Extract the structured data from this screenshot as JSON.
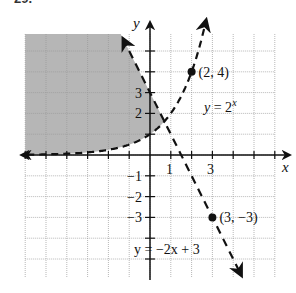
{
  "top_label": "29.",
  "chart_data": {
    "type": "line",
    "title": "",
    "xlabel": "x",
    "ylabel": "y",
    "xlim": [
      -6,
      6
    ],
    "ylim": [
      -6,
      6
    ],
    "grid": true,
    "x_tick_labels": [
      "1",
      "3"
    ],
    "y_tick_labels": [
      "3",
      "2",
      "-1",
      "-2",
      "-3"
    ],
    "series": [
      {
        "name": "y = 2^x",
        "label_text": "y = 2",
        "label_sup": "x",
        "style": "dashed",
        "func": "2^x",
        "boundary": "dashed"
      },
      {
        "name": "y = -2x + 3",
        "label_text": "y = −2x + 3",
        "style": "dashed",
        "func": "-2x+3",
        "boundary": "dashed"
      }
    ],
    "points": [
      {
        "x": 2,
        "y": 4,
        "label": "(2, 4)"
      },
      {
        "x": 3,
        "y": -3,
        "label": "(3, −3)"
      }
    ],
    "shaded_region": "y > 2^x and y > -2x + 3 (left region above both curves)",
    "shade_color": "#a9a9a9"
  }
}
